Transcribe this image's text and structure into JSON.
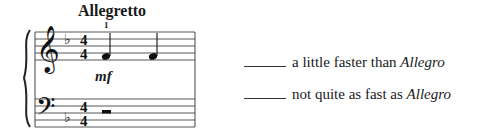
{
  "tempo_marking": "Allegretto",
  "fingering": "1",
  "dynamic": "mf",
  "score": {
    "treble": {
      "clef": "treble",
      "key_signature": "1 flat",
      "time_signature": "4/4",
      "notes": [
        "F4 quarter",
        "F4 quarter"
      ]
    },
    "bass": {
      "clef": "bass",
      "key_signature": "1 flat",
      "time_signature": "4/4",
      "rest": "half rest"
    }
  },
  "answers": [
    {
      "blank": "_____",
      "text": "a little faster than ",
      "term": "Allegro"
    },
    {
      "blank": "_____",
      "text": "not quite as fast as ",
      "term": "Allegro"
    }
  ]
}
